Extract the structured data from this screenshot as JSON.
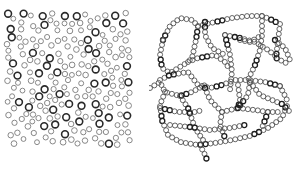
{
  "figure": {
    "panels": [
      {
        "id": "dispersed",
        "description": "Randomly dispersed ring particles",
        "region": {
          "x0": 7,
          "y0": 13,
          "x1": 130,
          "y1": 145
        },
        "particle_count": 210,
        "ring_radius_range": [
          2.4,
          3.4
        ],
        "bold_fraction": 0.35,
        "seed": 17
      },
      {
        "id": "network",
        "description": "Particles aggregated into a chain network",
        "ring_radius": 2.5,
        "spacing": 5,
        "chains": [
          [
            [
              163,
              40
            ],
            [
              170,
              26
            ],
            [
              180,
              18
            ],
            [
              192,
              20
            ],
            [
              198,
              26
            ],
            [
              196,
              40
            ],
            [
              192,
              58
            ],
            [
              188,
              62
            ]
          ],
          [
            [
              163,
              40
            ],
            [
              160,
              55
            ],
            [
              162,
              68
            ],
            [
              170,
              73
            ],
            [
              188,
              62
            ]
          ],
          [
            [
              188,
              62
            ],
            [
              198,
              58
            ],
            [
              215,
              55
            ],
            [
              225,
              62
            ],
            [
              230,
              70
            ]
          ],
          [
            [
              198,
              26
            ],
            [
              215,
              22
            ],
            [
              232,
              18
            ],
            [
              248,
              16
            ],
            [
              262,
              16
            ],
            [
              272,
              20
            ],
            [
              280,
              24
            ]
          ],
          [
            [
              262,
              16
            ],
            [
              262,
              35
            ],
            [
              260,
              50
            ],
            [
              255,
              65
            ],
            [
              248,
              80
            ]
          ],
          [
            [
              280,
              24
            ],
            [
              278,
              40
            ],
            [
              276,
              58
            ],
            [
              290,
              65
            ]
          ],
          [
            [
              240,
              40
            ],
            [
              250,
              42
            ],
            [
              262,
              35
            ]
          ],
          [
            [
              225,
              35
            ],
            [
              240,
              38
            ],
            [
              255,
              42
            ],
            [
              268,
              50
            ],
            [
              278,
              58
            ]
          ],
          [
            [
              225,
              35
            ],
            [
              230,
              55
            ],
            [
              232,
              72
            ],
            [
              230,
              90
            ]
          ],
          [
            [
              205,
              22
            ],
            [
              205,
              35
            ],
            [
              212,
              48
            ],
            [
              225,
              55
            ]
          ],
          [
            [
              160,
              80
            ],
            [
              170,
              75
            ],
            [
              188,
              72
            ],
            [
              198,
              85
            ],
            [
              210,
              88
            ],
            [
              222,
              85
            ],
            [
              235,
              80
            ],
            [
              248,
              80
            ],
            [
              265,
              82
            ],
            [
              280,
              86
            ]
          ],
          [
            [
              150,
              88
            ],
            [
              160,
              82
            ],
            [
              165,
              92
            ],
            [
              180,
              96
            ],
            [
              192,
              92
            ],
            [
              205,
              85
            ]
          ],
          [
            [
              165,
              92
            ],
            [
              160,
              105
            ],
            [
              162,
              120
            ],
            [
              168,
              135
            ],
            [
              180,
              142
            ],
            [
              198,
              145
            ],
            [
              215,
              143
            ],
            [
              232,
              140
            ],
            [
              250,
              136
            ],
            [
              268,
              128
            ],
            [
              282,
              118
            ],
            [
              287,
              106
            ]
          ],
          [
            [
              160,
              108
            ],
            [
              178,
              112
            ],
            [
              195,
              112
            ],
            [
              203,
              110
            ]
          ],
          [
            [
              180,
              96
            ],
            [
              188,
              108
            ],
            [
              195,
              128
            ],
            [
              205,
              143
            ]
          ],
          [
            [
              200,
              145
            ],
            [
              205,
              155
            ],
            [
              207,
              160
            ]
          ],
          [
            [
              205,
              88
            ],
            [
              210,
              100
            ],
            [
              222,
              112
            ],
            [
              238,
              108
            ],
            [
              248,
              95
            ],
            [
              250,
              82
            ]
          ],
          [
            [
              222,
              112
            ],
            [
              220,
              125
            ],
            [
              225,
              138
            ]
          ],
          [
            [
              238,
              108
            ],
            [
              255,
              110
            ],
            [
              268,
              112
            ],
            [
              280,
              112
            ]
          ],
          [
            [
              268,
              112
            ],
            [
              262,
              128
            ]
          ],
          [
            [
              250,
              82
            ],
            [
              260,
              95
            ],
            [
              272,
              100
            ],
            [
              282,
              104
            ],
            [
              290,
              112
            ]
          ],
          [
            [
              280,
              86
            ],
            [
              287,
              100
            ]
          ],
          [
            [
              238,
              85
            ],
            [
              240,
              100
            ],
            [
              238,
              108
            ]
          ],
          [
            [
              275,
              40
            ],
            [
              285,
              48
            ],
            [
              290,
              60
            ]
          ],
          [
            [
              170,
              125
            ],
            [
              190,
              127
            ],
            [
              210,
              130
            ],
            [
              230,
              128
            ],
            [
              245,
              125
            ]
          ]
        ]
      }
    ]
  },
  "colors": {
    "bold_ring": "#2a2a2a",
    "thin_ring": "#7a7a7a",
    "chain_ring": "#555555",
    "chain_ring_dark": "#1e1e1e",
    "background": "#ffffff"
  }
}
